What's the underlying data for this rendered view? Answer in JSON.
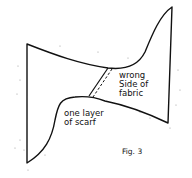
{
  "figure": {
    "caption": "Fig. 3",
    "labels": {
      "wrong_side_line1": "wrong",
      "wrong_side_line2": "Side of",
      "wrong_side_line3": "fabric",
      "one_layer_line1": "one layer",
      "one_layer_line2": "of scarf"
    },
    "colors": {
      "stroke": "#111111",
      "background": "#ffffff"
    }
  }
}
